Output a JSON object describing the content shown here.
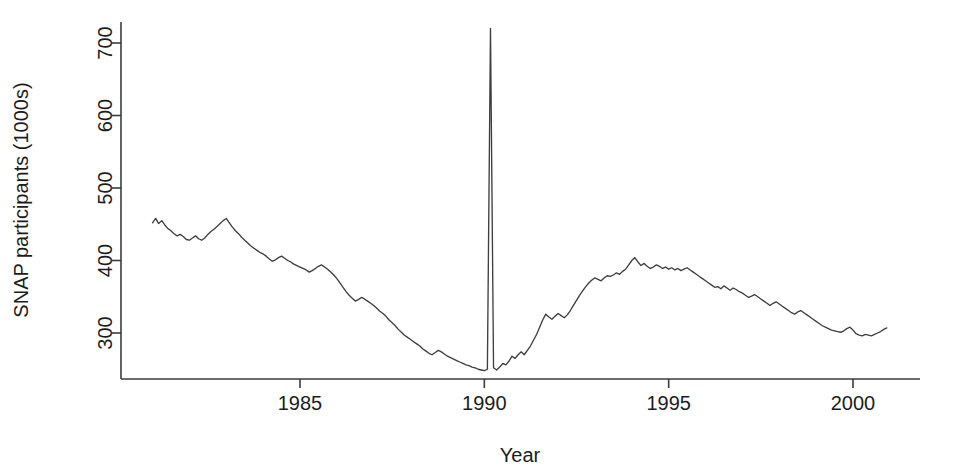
{
  "chart_data": {
    "type": "line",
    "title": "",
    "subtitle": "",
    "xlabel": "Year",
    "ylabel": "SNAP participants (1000s)",
    "xlim": [
      1981.0,
      2000.95
    ],
    "ylim": [
      243,
      725
    ],
    "xticks": [
      1985,
      1990,
      1995,
      2000
    ],
    "xticklabels": [
      "1985",
      "1990",
      "1995",
      "2000"
    ],
    "yticks": [
      300,
      400,
      500,
      600,
      700
    ],
    "yticklabels": [
      "300",
      "400",
      "500",
      "600",
      "700"
    ],
    "grid": false,
    "legend": null,
    "legend_position": "none",
    "line_color": "#3f3f3f",
    "series": [
      {
        "name": "SNAP participants (1000s)",
        "units": "thousands of participants",
        "x": [
          1981.0,
          1981.083,
          1981.167,
          1981.25,
          1981.333,
          1981.417,
          1981.5,
          1981.583,
          1981.667,
          1981.75,
          1981.833,
          1981.917,
          1982.0,
          1982.083,
          1982.167,
          1982.25,
          1982.333,
          1982.417,
          1982.5,
          1982.583,
          1982.667,
          1982.75,
          1982.833,
          1982.917,
          1983.0,
          1983.083,
          1983.167,
          1983.25,
          1983.333,
          1983.417,
          1983.5,
          1983.583,
          1983.667,
          1983.75,
          1983.833,
          1983.917,
          1984.0,
          1984.083,
          1984.167,
          1984.25,
          1984.333,
          1984.417,
          1984.5,
          1984.583,
          1984.667,
          1984.75,
          1984.833,
          1984.917,
          1985.0,
          1985.083,
          1985.167,
          1985.25,
          1985.333,
          1985.417,
          1985.5,
          1985.583,
          1985.667,
          1985.75,
          1985.833,
          1985.917,
          1986.0,
          1986.083,
          1986.167,
          1986.25,
          1986.333,
          1986.417,
          1986.5,
          1986.583,
          1986.667,
          1986.75,
          1986.833,
          1986.917,
          1987.0,
          1987.083,
          1987.167,
          1987.25,
          1987.333,
          1987.417,
          1987.5,
          1987.583,
          1987.667,
          1987.75,
          1987.833,
          1987.917,
          1988.0,
          1988.083,
          1988.167,
          1988.25,
          1988.333,
          1988.417,
          1988.5,
          1988.583,
          1988.667,
          1988.75,
          1988.833,
          1988.917,
          1989.0,
          1989.083,
          1989.167,
          1989.25,
          1989.333,
          1989.417,
          1989.5,
          1989.583,
          1989.667,
          1989.75,
          1989.833,
          1989.917,
          1990.0,
          1990.083,
          1990.167,
          1990.25,
          1990.333,
          1990.417,
          1990.5,
          1990.583,
          1990.667,
          1990.75,
          1990.833,
          1990.917,
          1991.0,
          1991.083,
          1991.167,
          1991.25,
          1991.333,
          1991.417,
          1991.5,
          1991.583,
          1991.667,
          1991.75,
          1991.833,
          1991.917,
          1992.0,
          1992.083,
          1992.167,
          1992.25,
          1992.333,
          1992.417,
          1992.5,
          1992.583,
          1992.667,
          1992.75,
          1992.833,
          1992.917,
          1993.0,
          1993.083,
          1993.167,
          1993.25,
          1993.333,
          1993.417,
          1993.5,
          1993.583,
          1993.667,
          1993.75,
          1993.833,
          1993.917,
          1994.0,
          1994.083,
          1994.167,
          1994.25,
          1994.333,
          1994.417,
          1994.5,
          1994.583,
          1994.667,
          1994.75,
          1994.833,
          1994.917,
          1995.0,
          1995.083,
          1995.167,
          1995.25,
          1995.333,
          1995.417,
          1995.5,
          1995.583,
          1995.667,
          1995.75,
          1995.833,
          1995.917,
          1996.0,
          1996.083,
          1996.167,
          1996.25,
          1996.333,
          1996.417,
          1996.5,
          1996.583,
          1996.667,
          1996.75,
          1996.833,
          1996.917,
          1997.0,
          1997.083,
          1997.167,
          1997.25,
          1997.333,
          1997.417,
          1997.5,
          1997.583,
          1997.667,
          1997.75,
          1997.833,
          1997.917,
          1998.0,
          1998.083,
          1998.167,
          1998.25,
          1998.333,
          1998.417,
          1998.5,
          1998.583,
          1998.667,
          1998.75,
          1998.833,
          1998.917,
          1999.0,
          1999.083,
          1999.167,
          1999.25,
          1999.333,
          1999.417,
          1999.5,
          1999.583,
          1999.667,
          1999.75,
          1999.833,
          1999.917,
          2000.0,
          2000.083,
          2000.167,
          2000.25,
          2000.333,
          2000.417,
          2000.5,
          2000.583,
          2000.667,
          2000.75,
          2000.833,
          2000.917
        ],
        "y": [
          452,
          458,
          451,
          455,
          449,
          444,
          441,
          437,
          434,
          436,
          433,
          429,
          428,
          431,
          434,
          430,
          428,
          431,
          436,
          440,
          443,
          447,
          451,
          455,
          458,
          452,
          446,
          441,
          437,
          432,
          428,
          424,
          420,
          417,
          414,
          411,
          409,
          406,
          402,
          399,
          401,
          404,
          406,
          403,
          400,
          398,
          395,
          393,
          391,
          389,
          387,
          384,
          386,
          389,
          392,
          394,
          391,
          388,
          384,
          380,
          375,
          369,
          363,
          357,
          352,
          348,
          344,
          346,
          349,
          347,
          344,
          341,
          338,
          334,
          330,
          327,
          323,
          318,
          314,
          310,
          305,
          301,
          297,
          294,
          291,
          288,
          285,
          282,
          278,
          275,
          272,
          270,
          273,
          276,
          274,
          271,
          268,
          266,
          264,
          262,
          260,
          258,
          256,
          255,
          253,
          252,
          250,
          249,
          248,
          250,
          720,
          252,
          249,
          253,
          258,
          256,
          261,
          268,
          265,
          270,
          274,
          270,
          276,
          282,
          290,
          298,
          308,
          318,
          326,
          322,
          319,
          323,
          327,
          324,
          321,
          325,
          331,
          338,
          345,
          352,
          358,
          364,
          369,
          373,
          376,
          374,
          372,
          376,
          379,
          378,
          380,
          383,
          381,
          385,
          388,
          394,
          400,
          404,
          398,
          393,
          396,
          392,
          389,
          391,
          394,
          392,
          389,
          391,
          388,
          390,
          387,
          389,
          386,
          388,
          390,
          387,
          384,
          381,
          378,
          375,
          372,
          369,
          366,
          363,
          364,
          361,
          365,
          362,
          359,
          362,
          360,
          357,
          355,
          352,
          349,
          351,
          353,
          350,
          347,
          344,
          341,
          338,
          341,
          343,
          340,
          337,
          334,
          331,
          328,
          326,
          329,
          331,
          328,
          325,
          322,
          319,
          316,
          313,
          310,
          308,
          306,
          304,
          303,
          302,
          301,
          303,
          306,
          308,
          304,
          299,
          297,
          296,
          298,
          297,
          296,
          298,
          300,
          302,
          305,
          307
        ]
      }
    ],
    "annotations": [
      {
        "label": "spike",
        "x": 1990.167,
        "y": 720,
        "note": "Sharp single-month spike near 1990"
      }
    ]
  },
  "axes": {
    "y_axis_title": "SNAP participants (1000s)",
    "x_axis_title": "Year"
  }
}
